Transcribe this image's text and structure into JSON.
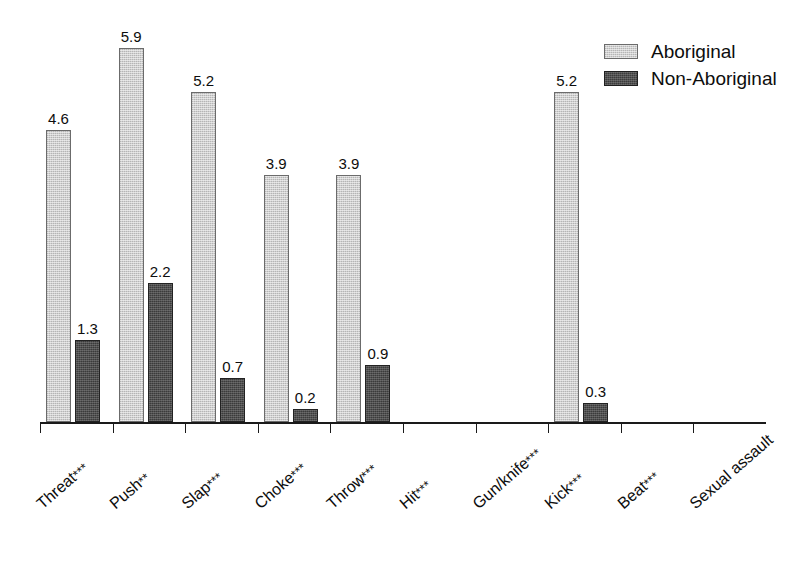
{
  "chart_data": {
    "type": "bar",
    "title": "",
    "subtitle": "",
    "xlabel": "",
    "ylabel": "",
    "ylim": [
      0,
      6.3
    ],
    "grid": false,
    "legend_position": "top-right",
    "value_label_format": "one-decimal",
    "categories": [
      "Threat***",
      "Push**",
      "Slap***",
      "Choke***",
      "Throw***",
      "Hit***",
      "Gun/knife***",
      "Kick***",
      "Beat***",
      "Sexual assault"
    ],
    "category_names": [
      "Threat",
      "Push",
      "Slap",
      "Choke",
      "Throw",
      "Hit",
      "Gun/knife",
      "Kick",
      "Beat",
      "Sexual assault"
    ],
    "category_significance": [
      "***",
      "**",
      "***",
      "***",
      "***",
      "***",
      "***",
      "***",
      "***",
      ""
    ],
    "series": [
      {
        "name": "Aboriginal",
        "color": "#cfcfcf",
        "values": [
          4.6,
          5.9,
          5.2,
          3.9,
          3.9,
          0,
          0,
          5.2,
          0,
          0
        ],
        "labels": [
          "4.6",
          "5.9",
          "5.2",
          "3.9",
          "3.9",
          "",
          "",
          "5.2",
          "",
          ""
        ]
      },
      {
        "name": "Non-Aboriginal",
        "color": "#3b3b3b",
        "values": [
          1.3,
          2.2,
          0.7,
          0.2,
          0.9,
          0,
          0,
          0.3,
          0,
          0
        ],
        "labels": [
          "1.3",
          "2.2",
          "0.7",
          "0.2",
          "0.9",
          "",
          "",
          "0.3",
          "",
          ""
        ]
      }
    ]
  },
  "legend": {
    "items": [
      {
        "label": "Aboriginal",
        "swatch": "light-gray-swatch"
      },
      {
        "label": "Non-Aboriginal",
        "swatch": "dark-gray-swatch"
      }
    ]
  }
}
